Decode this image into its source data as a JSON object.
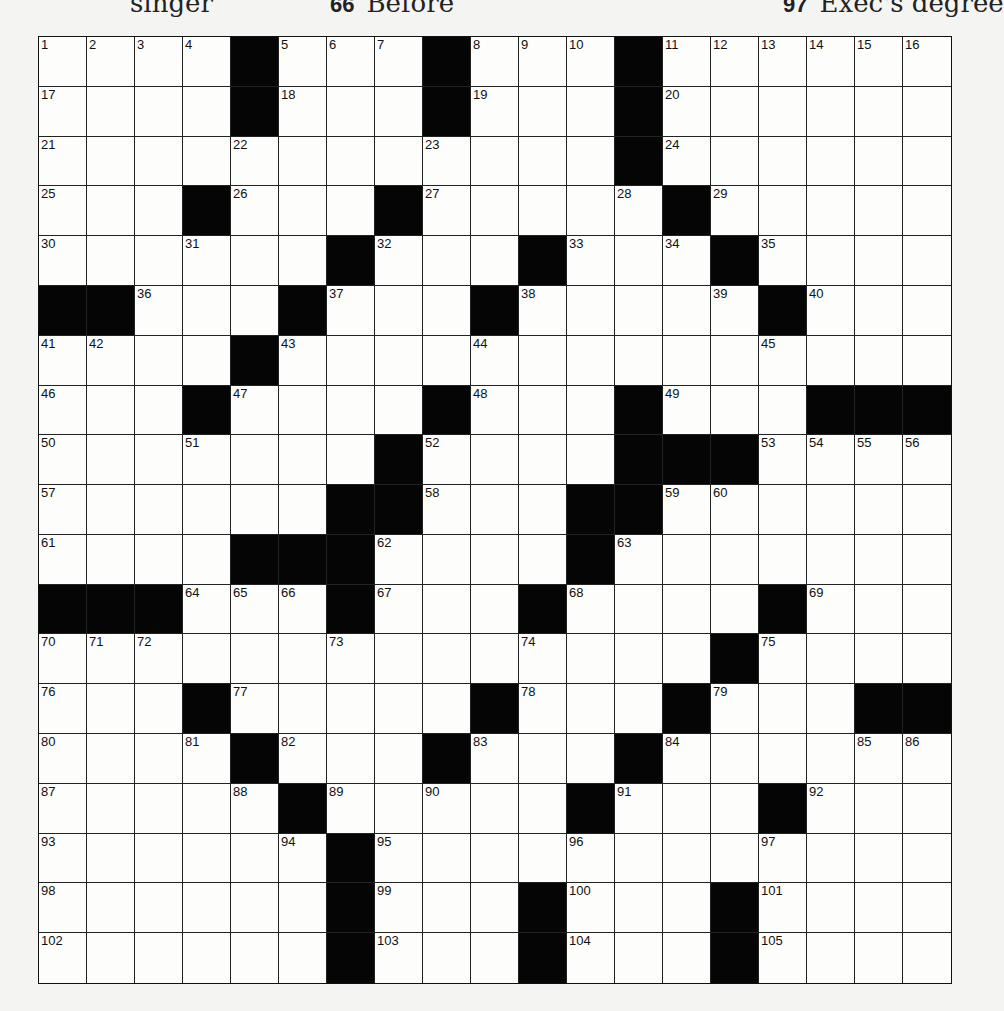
{
  "header_fragments": [
    {
      "number": "",
      "text": "singer",
      "x": 118
    },
    {
      "number": "66",
      "text": "Before",
      "x": 375
    },
    {
      "number": "97",
      "text": "Exec's degree",
      "x": 810
    }
  ],
  "grid": {
    "rows": 19,
    "cols": 19,
    "colors": {
      "block": "#050505",
      "cell": "#fdfdfc",
      "line": "#222222"
    },
    "layout": [
      [
        "1",
        "2",
        "3",
        "4",
        "#",
        "5",
        "6",
        "7",
        "#",
        "8",
        "9",
        "10",
        "#",
        "11",
        "12",
        "13",
        "14",
        "15",
        "16"
      ],
      [
        "17",
        ".",
        ".",
        ".",
        "#",
        "18",
        ".",
        ".",
        "#",
        "19",
        ".",
        ".",
        "#",
        "20",
        ".",
        ".",
        ".",
        ".",
        "."
      ],
      [
        "21",
        ".",
        ".",
        ".",
        "22",
        ".",
        ".",
        ".",
        "23",
        ".",
        ".",
        ".",
        "#",
        "24",
        ".",
        ".",
        ".",
        ".",
        "."
      ],
      [
        "25",
        ".",
        ".",
        "#",
        "26",
        ".",
        ".",
        "#",
        "27",
        ".",
        ".",
        ".",
        "28",
        "#",
        "29",
        ".",
        ".",
        ".",
        "."
      ],
      [
        "30",
        ".",
        ".",
        "31",
        ".",
        ".",
        "#",
        "32",
        ".",
        ".",
        "#",
        "33",
        ".",
        "34",
        "#",
        "35",
        ".",
        ".",
        "."
      ],
      [
        "#",
        "#",
        "36",
        ".",
        ".",
        "#",
        "37",
        ".",
        ".",
        "#",
        "38",
        ".",
        ".",
        ".",
        "39",
        "#",
        "40",
        ".",
        "."
      ],
      [
        "41",
        "42",
        ".",
        ".",
        "#",
        "43",
        ".",
        ".",
        ".",
        "44",
        ".",
        ".",
        ".",
        ".",
        ".",
        "45",
        ".",
        ".",
        "."
      ],
      [
        "46",
        ".",
        ".",
        "#",
        "47",
        ".",
        ".",
        ".",
        "#",
        "48",
        ".",
        ".",
        "#",
        "49",
        ".",
        ".",
        "#",
        "#",
        "#"
      ],
      [
        "50",
        ".",
        ".",
        "51",
        ".",
        ".",
        ".",
        "#",
        "52",
        ".",
        ".",
        ".",
        "#",
        "#",
        "#",
        "53",
        "54",
        "55",
        "56"
      ],
      [
        "57",
        ".",
        ".",
        ".",
        ".",
        ".",
        "#",
        "#",
        "58",
        ".",
        ".",
        "#",
        "#",
        "59",
        "60",
        ".",
        ".",
        ".",
        "."
      ],
      [
        "61",
        ".",
        ".",
        ".",
        "#",
        "#",
        "#",
        "62",
        ".",
        ".",
        ".",
        "#",
        "63",
        ".",
        ".",
        ".",
        ".",
        ".",
        "."
      ],
      [
        "#",
        "#",
        "#",
        "64",
        "65",
        "66",
        "#",
        "67",
        ".",
        ".",
        "#",
        "68",
        ".",
        ".",
        ".",
        "#",
        "69",
        ".",
        "."
      ],
      [
        "70",
        "71",
        "72",
        ".",
        ".",
        ".",
        "73",
        ".",
        ".",
        ".",
        "74",
        ".",
        ".",
        ".",
        "#",
        "75",
        ".",
        ".",
        "."
      ],
      [
        "76",
        ".",
        ".",
        "#",
        "77",
        ".",
        ".",
        ".",
        ".",
        "#",
        "78",
        ".",
        ".",
        "#",
        "79",
        ".",
        ".",
        "#",
        "#"
      ],
      [
        "80",
        ".",
        ".",
        "81",
        "#",
        "82",
        ".",
        ".",
        "#",
        "83",
        ".",
        ".",
        "#",
        "84",
        ".",
        ".",
        ".",
        "85",
        "86"
      ],
      [
        "87",
        ".",
        ".",
        ".",
        "88",
        "#",
        "89",
        ".",
        "90",
        ".",
        ".",
        "#",
        "91",
        ".",
        ".",
        "#",
        "92",
        ".",
        "."
      ],
      [
        "93",
        ".",
        ".",
        ".",
        ".",
        "94",
        "#",
        "95",
        ".",
        ".",
        ".",
        "96",
        ".",
        ".",
        ".",
        "97",
        ".",
        ".",
        "."
      ],
      [
        "98",
        ".",
        ".",
        ".",
        ".",
        ".",
        "#",
        "99",
        ".",
        ".",
        "#",
        "100",
        ".",
        ".",
        "#",
        "101",
        ".",
        ".",
        "."
      ],
      [
        "102",
        ".",
        ".",
        ".",
        ".",
        ".",
        "#",
        "103",
        ".",
        ".",
        "#",
        "104",
        ".",
        ".",
        "#",
        "105",
        ".",
        ".",
        "."
      ]
    ]
  }
}
